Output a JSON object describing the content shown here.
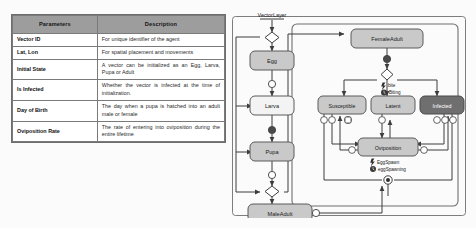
{
  "table": {
    "headers": [
      "Parameters",
      "Description"
    ],
    "rows": [
      {
        "name": "Vector ID",
        "desc": "For unique identifier of the agent"
      },
      {
        "name": "Lat, Lon",
        "desc": "For spatial placement and movements"
      },
      {
        "name": "Initial State",
        "desc": "A vector can be initialized as an Egg, Larva, Pupa or Adult"
      },
      {
        "name": "Is Infected",
        "desc": "Whether the vector is infected at the time of initialization."
      },
      {
        "name": "Day of Birth",
        "desc": "The day when a pupa is hatched into an adult male or female"
      },
      {
        "name": "Oviposition Rate",
        "desc": "The rate of entering into oviposition during the entire lifetime"
      }
    ]
  },
  "diagram": {
    "title": "VectorLayer",
    "nodes": {
      "egg": "Egg",
      "larva": "Larva",
      "pupa": "Pupa",
      "male_adult": "MaleAdult",
      "female_adult": "FemaleAdult",
      "susceptible": "Susceptible",
      "latent": "Latent",
      "infected": "Infected",
      "oviposition": "Oviposition"
    },
    "event_labels": {
      "bite": "bite",
      "biting": "Biting",
      "egg_spawn": "EggSpawn",
      "egg_spawning": "eggSpawning"
    },
    "icons": {
      "bolt": "bolt-icon",
      "clock": "clock-icon",
      "decision": "decision-diamond-icon",
      "initial": "initial-node-icon",
      "transition": "transition-circle-icon"
    },
    "colors": {
      "node_fill": "#c9c9c9",
      "node_light_fill": "#f3f3f3",
      "infected_fill": "#6f6f6f",
      "stroke": "#4a4a4a",
      "text": "#1a1a1a",
      "infected_text": "#ffffff"
    }
  }
}
